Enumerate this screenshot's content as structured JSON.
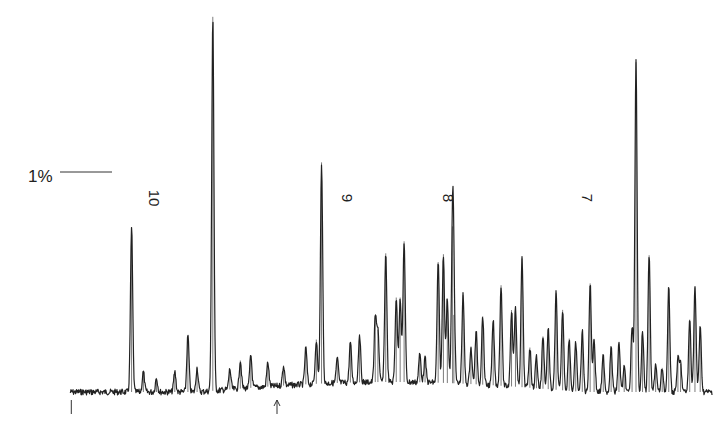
{
  "chart_data": {
    "type": "line",
    "title": "",
    "xlabel": "",
    "ylabel": "",
    "grid": false,
    "legend": "none",
    "scale_bar": {
      "label": "1%",
      "value_percent": 1
    },
    "markers": [
      {
        "label": "10",
        "x": 10
      },
      {
        "label": "9",
        "x": 9
      },
      {
        "label": "8",
        "x": 8
      },
      {
        "label": "7",
        "x": 7
      }
    ],
    "xlim": [
      10.85,
      5.95
    ],
    "ylim": [
      0,
      9.3
    ],
    "baseline_ticks": [
      {
        "label": "start-tick",
        "x": 10.84
      },
      {
        "label": "arrow-tick",
        "x": 9.27
      }
    ],
    "series": [
      {
        "name": "spectrum",
        "color": "#222222",
        "peaks": [
          {
            "x": 10.38,
            "y": 4.1
          },
          {
            "x": 10.29,
            "y": 0.5
          },
          {
            "x": 10.19,
            "y": 0.35
          },
          {
            "x": 10.05,
            "y": 0.5
          },
          {
            "x": 9.95,
            "y": 1.4
          },
          {
            "x": 9.88,
            "y": 0.6
          },
          {
            "x": 9.76,
            "y": 9.3
          },
          {
            "x": 9.63,
            "y": 0.5
          },
          {
            "x": 9.55,
            "y": 0.7
          },
          {
            "x": 9.47,
            "y": 0.8
          },
          {
            "x": 9.34,
            "y": 0.6
          },
          {
            "x": 9.22,
            "y": 0.5
          },
          {
            "x": 9.05,
            "y": 0.9
          },
          {
            "x": 8.97,
            "y": 1.1
          },
          {
            "x": 8.93,
            "y": 5.5
          },
          {
            "x": 8.81,
            "y": 0.6
          },
          {
            "x": 8.71,
            "y": 1.0
          },
          {
            "x": 8.64,
            "y": 1.2
          },
          {
            "x": 8.52,
            "y": 1.6
          },
          {
            "x": 8.5,
            "y": 1.3
          },
          {
            "x": 8.44,
            "y": 3.2
          },
          {
            "x": 8.36,
            "y": 2.1
          },
          {
            "x": 8.33,
            "y": 2.1
          },
          {
            "x": 8.3,
            "y": 3.5
          },
          {
            "x": 8.18,
            "y": 0.7
          },
          {
            "x": 8.14,
            "y": 0.6
          },
          {
            "x": 8.04,
            "y": 3.0
          },
          {
            "x": 8.0,
            "y": 3.2
          },
          {
            "x": 7.97,
            "y": 2.1
          },
          {
            "x": 7.93,
            "y": 3.9
          },
          {
            "x": 7.92,
            "y": 1.7
          },
          {
            "x": 7.85,
            "y": 2.2
          },
          {
            "x": 7.79,
            "y": 0.9
          },
          {
            "x": 7.75,
            "y": 1.3
          },
          {
            "x": 7.7,
            "y": 1.7
          },
          {
            "x": 7.62,
            "y": 1.6
          },
          {
            "x": 7.56,
            "y": 2.5
          },
          {
            "x": 7.48,
            "y": 1.9
          },
          {
            "x": 7.45,
            "y": 2.0
          },
          {
            "x": 7.4,
            "y": 3.2
          },
          {
            "x": 7.34,
            "y": 1.0
          },
          {
            "x": 7.29,
            "y": 0.8
          },
          {
            "x": 7.24,
            "y": 1.3
          },
          {
            "x": 7.2,
            "y": 1.5
          },
          {
            "x": 7.14,
            "y": 2.4
          },
          {
            "x": 7.09,
            "y": 2.0
          },
          {
            "x": 7.04,
            "y": 1.3
          },
          {
            "x": 6.99,
            "y": 1.2
          },
          {
            "x": 6.94,
            "y": 1.5
          },
          {
            "x": 6.88,
            "y": 2.7
          },
          {
            "x": 6.85,
            "y": 1.3
          },
          {
            "x": 6.78,
            "y": 0.9
          },
          {
            "x": 6.72,
            "y": 1.1
          },
          {
            "x": 6.66,
            "y": 1.2
          },
          {
            "x": 6.62,
            "y": 0.6
          },
          {
            "x": 6.56,
            "y": 1.6
          },
          {
            "x": 6.53,
            "y": 8.2
          },
          {
            "x": 6.48,
            "y": 1.5
          },
          {
            "x": 6.43,
            "y": 3.4
          },
          {
            "x": 6.38,
            "y": 0.7
          },
          {
            "x": 6.33,
            "y": 0.6
          },
          {
            "x": 6.28,
            "y": 2.6
          },
          {
            "x": 6.21,
            "y": 0.8
          },
          {
            "x": 6.19,
            "y": 0.7
          },
          {
            "x": 6.12,
            "y": 1.8
          },
          {
            "x": 6.08,
            "y": 2.6
          },
          {
            "x": 6.04,
            "y": 1.6
          }
        ]
      }
    ]
  }
}
